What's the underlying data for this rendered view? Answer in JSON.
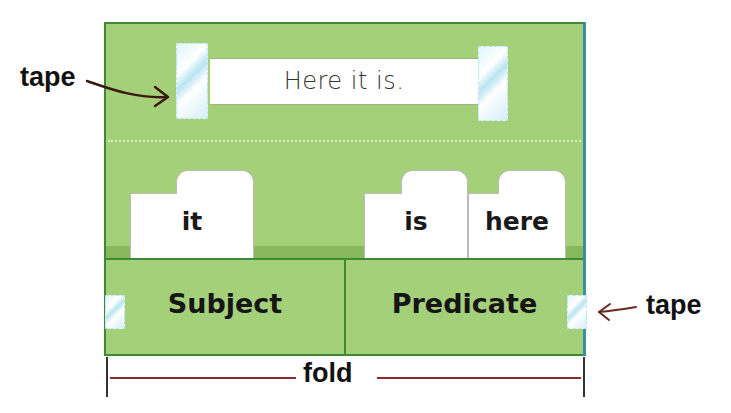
{
  "diagram": {
    "type": "sentence-sort pocket chart",
    "sentence_strip": {
      "text": "Here it is."
    },
    "word_cards": [
      {
        "label": "it",
        "column": "Subject"
      },
      {
        "label": "is",
        "column": "Predicate"
      },
      {
        "label": "here",
        "column": "Predicate"
      }
    ],
    "columns": [
      {
        "label": "Subject"
      },
      {
        "label": "Predicate"
      }
    ],
    "callouts": {
      "tape_top_left": "tape",
      "tape_bottom_right": "tape",
      "fold": "fold"
    },
    "colors": {
      "board": "#a5d07a",
      "border": "#3e8a34",
      "tape": "#b8e4f2",
      "arrow": "#4a1a10",
      "fold_line": "#8a2a2a"
    }
  }
}
